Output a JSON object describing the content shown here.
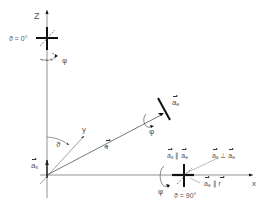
{
  "diagram": {
    "axes": {
      "z_label": "Z",
      "x_label": "x",
      "y_label": "y"
    },
    "top_pole": {
      "theta_label": "ϑ = 0°",
      "rotation_label": "φ"
    },
    "equator_pole": {
      "theta_label": "ϑ = 90°",
      "rotation_label": "φ",
      "parallel_relation": {
        "left": "a",
        "left_sub": "s",
        "op": "∥",
        "right": "a",
        "right_sub": "e"
      },
      "perpendicular_relation": {
        "left": "a",
        "left_sub": "s",
        "op": "⊥",
        "right": "a",
        "right_sub": "e"
      },
      "radial_relation": {
        "left": "a",
        "left_sub": "e",
        "op": "∥",
        "right": "r"
      }
    },
    "general_point": {
      "vector_label": "a",
      "vector_sub": "e",
      "rotation_label": "φ",
      "radius_label": "r"
    },
    "origin": {
      "vector_label": "a",
      "vector_sub": "s",
      "angle_label": "ϑ"
    },
    "colors": {
      "line": "#555555",
      "bold": "#111111",
      "background": "#ffffff"
    }
  }
}
